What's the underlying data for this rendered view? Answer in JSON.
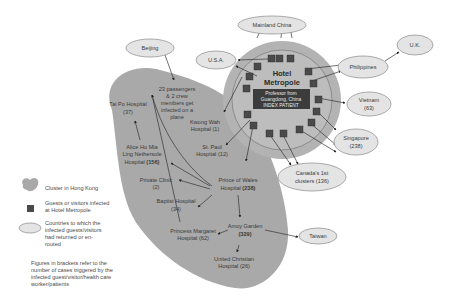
{
  "colors": {
    "cluster_fill": "#a9a9a9",
    "hotel_outer": "#b3b3b3",
    "hotel_inner": "#bdbdbd",
    "guest_square": "#4a4a4a",
    "country_fill": "#e4e4e4",
    "index_box": "#3c3c3c"
  },
  "hotel": {
    "title_line1": "Hotel",
    "title_line2": "Metropole",
    "index_line1": "Professor from",
    "index_line2": "Guangdong, China",
    "index_line3": "INDEX PATIENT"
  },
  "countries": {
    "mainland_china": "Mainland China",
    "usa": "U.S.A.",
    "beijing": "Beijing",
    "uk": "U.K.",
    "philippines": "Philippines",
    "vietnam_line1": "Vietnam",
    "vietnam_line2": "(63)",
    "singapore_line1": "Singapore",
    "singapore_line2": "(238)",
    "canada_line1": "Canada's 1st",
    "canada_line2": "clusters (136)",
    "taiwan": "Taiwan"
  },
  "hong_kong": {
    "plane_line1": "23 passengers",
    "plane_line2": "& 2 crew",
    "plane_line3": "members get",
    "plane_line4": "infected on a",
    "plane_line5": "plane",
    "kwong_wah_line1": "Kwong Wah",
    "kwong_wah_line2": "Hospital (1)",
    "tai_po_line1": "Tai Po Hospital",
    "tai_po_line2": "(37)",
    "st_paul_line1": "St. Paul",
    "st_paul_line2": "Hospital (12)",
    "alice_line1": "Alice Ho Mia",
    "alice_line2": "Ling Nethersole",
    "alice_line3_text": "Hospital ",
    "alice_line3_count": "(156)",
    "private_clinic_line1": "Private Clinic",
    "private_clinic_line2": "(2)",
    "prince_wales_line1": "Prince of Wales",
    "prince_wales_line2_text": "Hospital ",
    "prince_wales_line2_count": "(238)",
    "baptist_line1": "Baptist Hospital",
    "baptist_line2": "(34)",
    "amoy_line1": "Amoy Garden",
    "amoy_line2": "(329)",
    "princess_margaret_line1": "Princess Margaret",
    "princess_margaret_line2": "Hospital (62)",
    "united_christian_line1": "United Christian",
    "united_christian_line2": "Hospital (26)"
  },
  "legend": {
    "cluster": "Cluster in Hong Kong",
    "guests_line1": "Guests or visitors infected",
    "guests_line2": "at Hotel Metropole",
    "countries_line1": "Countries to which the",
    "countries_line2": "infected guests/visitors",
    "countries_line3": "had returned or en-",
    "countries_line4": "routed",
    "note_line1": "Figures in brackets refer to the",
    "note_line2": "number of cases triggered by the",
    "note_line3": "infected guest/visitor/health care",
    "note_line4": "worker/patients"
  }
}
